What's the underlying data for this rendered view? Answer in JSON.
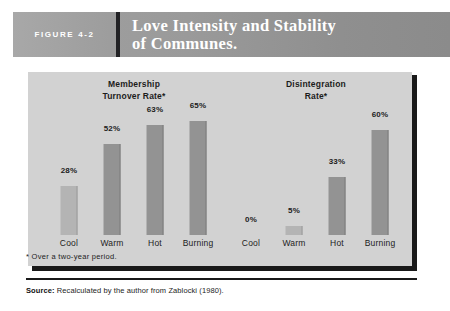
{
  "header": {
    "figure_label": "FIGURE 4-2",
    "title_line1": "Love Intensity and Stability",
    "title_line2": "of Communes."
  },
  "footnote": "* Over a two-year period.",
  "source": {
    "label": "Source:",
    "text": " Recalculated by the author from Zablocki (1980)."
  },
  "colors": {
    "panel_background": "#d2d2d2",
    "bar_fill": "#939393",
    "bar_fill_light": "#b4b4b4",
    "panel_shadow": "#191919",
    "header_divider": "#222225",
    "header_text": "#ffffff",
    "body_text": "#1c1c1c"
  },
  "chart_data": [
    {
      "type": "bar",
      "title": "Membership\nTurnover Rate*",
      "title_line1": "Membership",
      "title_line2": "Turnover Rate*",
      "categories": [
        "Cool",
        "Warm",
        "Hot",
        "Burning"
      ],
      "values": [
        28,
        52,
        63,
        65
      ],
      "value_labels": [
        "28%",
        "52%",
        "63%",
        "65%"
      ],
      "xlabel": "",
      "ylabel": "",
      "ylim": [
        0,
        75
      ],
      "grid": false,
      "legend": "none"
    },
    {
      "type": "bar",
      "title": "Disintegration\nRate*",
      "title_line1": "Disintegration",
      "title_line2": "Rate*",
      "categories": [
        "Cool",
        "Warm",
        "Hot",
        "Burning"
      ],
      "values": [
        0,
        5,
        33,
        60
      ],
      "value_labels": [
        "0%",
        "5%",
        "33%",
        "60%"
      ],
      "xlabel": "",
      "ylabel": "",
      "ylim": [
        0,
        75
      ],
      "grid": false,
      "legend": "none"
    }
  ]
}
